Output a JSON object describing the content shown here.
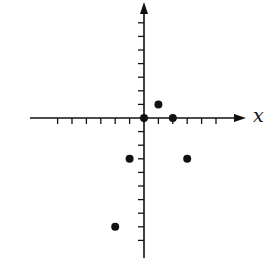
{
  "chart_data": {
    "type": "scatter",
    "title": "",
    "xlabel": "x",
    "ylabel": "",
    "grid": false,
    "legend": null,
    "xlim": [
      -6,
      6
    ],
    "ylim": [
      -10,
      7
    ],
    "x_ticks": [
      -6,
      -5,
      -4,
      -3,
      -2,
      -1,
      1,
      2,
      3,
      4,
      5
    ],
    "y_ticks": [
      -9,
      -8,
      -7,
      -6,
      -5,
      -4,
      -3,
      -2,
      -1,
      1,
      2,
      3,
      4,
      5,
      6,
      7
    ],
    "tick_labels_shown": false,
    "points": [
      {
        "x": 0,
        "y": 0
      },
      {
        "x": 1,
        "y": 1
      },
      {
        "x": 2,
        "y": 0
      },
      {
        "x": -1,
        "y": -3
      },
      {
        "x": 3,
        "y": -3
      },
      {
        "x": -2,
        "y": -8
      }
    ],
    "colors": {
      "ink": "#111111"
    }
  }
}
